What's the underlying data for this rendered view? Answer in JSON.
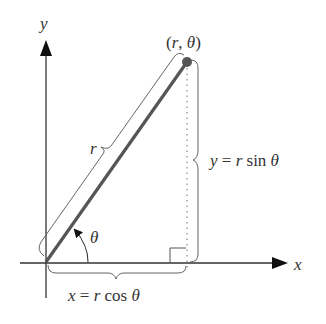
{
  "diagram": {
    "labels": {
      "y_axis": "y",
      "x_axis": "x",
      "point": "(r, θ)",
      "point_r": "r",
      "point_sep": ", ",
      "point_theta": "θ",
      "point_open": "(",
      "point_close": ")",
      "radius": "r",
      "angle": "θ",
      "y_eq_var": "y",
      "y_eq_sign": " = ",
      "y_eq_r": "r",
      "y_eq_fn": " sin ",
      "y_eq_theta": "θ",
      "x_eq_var": "x",
      "x_eq_sign": " = ",
      "x_eq_r": "r",
      "x_eq_fn": " cos ",
      "x_eq_theta": "θ"
    },
    "colors": {
      "axis": "#333333",
      "segment": "#555555",
      "point": "#555555",
      "brace": "#666666",
      "dotted": "#888888",
      "text": "#333333"
    }
  }
}
